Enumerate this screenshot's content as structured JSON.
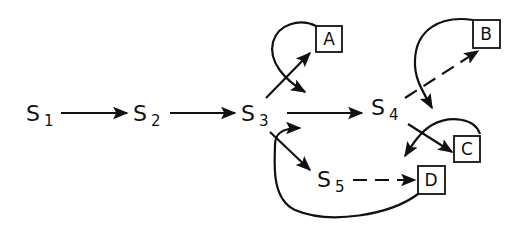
{
  "diagram": {
    "type": "state-transition",
    "nodes": [
      {
        "id": "S1",
        "label": "S",
        "sub": "1"
      },
      {
        "id": "S2",
        "label": "S",
        "sub": "2"
      },
      {
        "id": "S3",
        "label": "S",
        "sub": "3"
      },
      {
        "id": "S4",
        "label": "S",
        "sub": "4"
      },
      {
        "id": "S5",
        "label": "S",
        "sub": "5"
      }
    ],
    "terminals": [
      {
        "id": "A",
        "label": "A"
      },
      {
        "id": "B",
        "label": "B"
      },
      {
        "id": "C",
        "label": "C"
      },
      {
        "id": "D",
        "label": "D"
      }
    ],
    "edges": [
      {
        "from": "S1",
        "to": "S2",
        "style": "solid"
      },
      {
        "from": "S2",
        "to": "S3",
        "style": "solid"
      },
      {
        "from": "S3",
        "to": "S4",
        "style": "solid"
      },
      {
        "from": "S3",
        "to": "A",
        "style": "solid"
      },
      {
        "from": "A",
        "to": "S3",
        "style": "curved-return"
      },
      {
        "from": "S3",
        "to": "S5",
        "style": "solid"
      },
      {
        "from": "S4",
        "to": "B",
        "style": "dashed"
      },
      {
        "from": "B",
        "to": "S4",
        "style": "curved-return"
      },
      {
        "from": "S4",
        "to": "C",
        "style": "solid"
      },
      {
        "from": "C",
        "to": "S5-region",
        "style": "curved-return"
      },
      {
        "from": "S5",
        "to": "D",
        "style": "dashed"
      },
      {
        "from": "D",
        "to": "S3",
        "style": "curved-return"
      }
    ]
  }
}
